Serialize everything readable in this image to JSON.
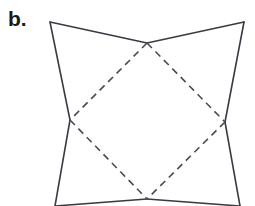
{
  "figure": {
    "panel_label": "b.",
    "background_color": "#ffffff",
    "stroke_color": "#3a3a44",
    "dashed_stroke_color": "#4a4a55",
    "stroke_width": 1.6,
    "dash_pattern": "7 5"
  },
  "chart_data": {
    "type": "diagram",
    "title": "b.",
    "coordinate_space": {
      "width": 255,
      "height": 206,
      "units": "pixels",
      "origin": "top-left"
    },
    "points": [
      {
        "id": "TL",
        "label": "top-left corner",
        "x": 50,
        "y": 22
      },
      {
        "id": "TR",
        "label": "top-right corner",
        "x": 244,
        "y": 22
      },
      {
        "id": "T",
        "label": "top diamond vertex",
        "x": 147,
        "y": 43
      },
      {
        "id": "L",
        "label": "left pinch vertex",
        "x": 70,
        "y": 120
      },
      {
        "id": "R",
        "label": "right pinch vertex",
        "x": 225,
        "y": 122
      },
      {
        "id": "B",
        "label": "bottom diamond vertex",
        "x": 147,
        "y": 199
      },
      {
        "id": "BL",
        "label": "bottom-left endpoint",
        "x": 55,
        "y": 206
      },
      {
        "id": "BR",
        "label": "bottom-right endpoint",
        "x": 240,
        "y": 206
      }
    ],
    "solid_edges": [
      {
        "name": "top-left-to-top-center",
        "from": "TL",
        "to": "T"
      },
      {
        "name": "top-center-to-top-right",
        "from": "T",
        "to": "TR"
      },
      {
        "name": "left-upper-side",
        "from": "TL",
        "to": "L"
      },
      {
        "name": "right-upper-side",
        "from": "TR",
        "to": "R"
      },
      {
        "name": "left-lower-side",
        "from": "L",
        "to": "BL"
      },
      {
        "name": "right-lower-side",
        "from": "R",
        "to": "BR"
      },
      {
        "name": "bottom-left-to-bottom-center",
        "from": "BL",
        "to": "B"
      },
      {
        "name": "bottom-center-to-bottom-right",
        "from": "B",
        "to": "BR"
      }
    ],
    "dashed_edges": [
      {
        "name": "diamond-top-left",
        "from": "T",
        "to": "L"
      },
      {
        "name": "diamond-top-right",
        "from": "T",
        "to": "R"
      },
      {
        "name": "diamond-bottom-left",
        "from": "L",
        "to": "B"
      },
      {
        "name": "diamond-bottom-right",
        "from": "R",
        "to": "B"
      }
    ],
    "legend": [],
    "grid": false
  }
}
